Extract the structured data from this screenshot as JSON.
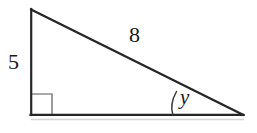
{
  "figure": {
    "type": "right-triangle",
    "background_color": "#ffffff",
    "stroke_color": "#262626",
    "marker_color": "#8c8c8c",
    "baseline_shadow_color": "#c8c8cc"
  },
  "labels": {
    "vertical_leg": "5",
    "hypotenuse": "8",
    "angle": "y"
  },
  "geometry": {
    "top_vertex": "31,9",
    "bottom_left_vertex": "31,115",
    "bottom_right_vertex": "243,115",
    "hypotenuse_path": "31,9 243,115",
    "vertical_leg_path": "31,9 31,115",
    "base_path": "31,115 243,115",
    "right_angle_square_path": "32,94 52,94 52,115",
    "angle_arc_path": "M 176,91 Q 170,104 173,115",
    "stroke_width": "2.2",
    "marker_stroke_width": "1.6",
    "arc_stroke_width": "1.4"
  }
}
